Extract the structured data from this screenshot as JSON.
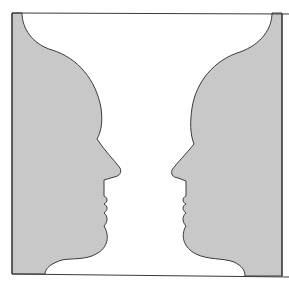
{
  "figure": {
    "elements": {
      "left_face": "Left face profile silhouette",
      "right_face": "Right face profile silhouette",
      "vase": "Central white vase"
    }
  },
  "colors": {
    "background": "#ffffff",
    "silhouette_fill": "#c8c8c8",
    "outline": "#3a3a3a"
  }
}
